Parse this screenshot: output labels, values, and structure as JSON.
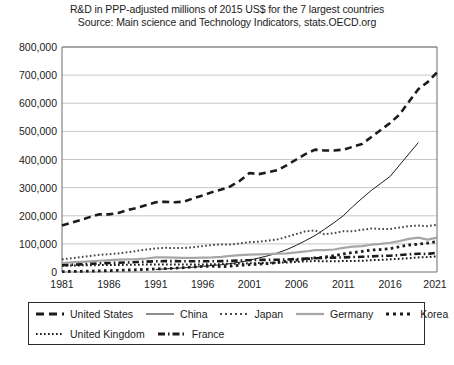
{
  "chart_data": {
    "type": "line",
    "title": "R&D in PPP-adjusted millions of 2015 US$ for the 7 largest countries",
    "subtitle": "Source: Main science and Technology Indicators, stats.OECD.org",
    "xlabel": "",
    "ylabel": "",
    "xlim": [
      1981,
      2021
    ],
    "ylim": [
      0,
      800000
    ],
    "grid": true,
    "legend_position": "bottom",
    "x_ticks": [
      "1981",
      "1986",
      "1991",
      "1996",
      "2001",
      "2006",
      "2011",
      "2016",
      "2021"
    ],
    "y_ticks": [
      "0",
      "100,000",
      "200,000",
      "300,000",
      "400,000",
      "500,000",
      "600,000",
      "700,000",
      "800,000"
    ],
    "x": [
      1981,
      1982,
      1983,
      1984,
      1985,
      1986,
      1987,
      1988,
      1989,
      1990,
      1991,
      1992,
      1993,
      1994,
      1995,
      1996,
      1997,
      1998,
      1999,
      2000,
      2001,
      2002,
      2003,
      2004,
      2005,
      2006,
      2007,
      2008,
      2009,
      2010,
      2011,
      2012,
      2013,
      2014,
      2015,
      2016,
      2017,
      2018,
      2019,
      2020,
      2021
    ],
    "series": [
      {
        "name": "United States",
        "style": "thick-dashed",
        "color": "#1b1b1b",
        "values": [
          165000,
          175000,
          185000,
          196000,
          205000,
          205000,
          210000,
          220000,
          228000,
          238000,
          248000,
          250000,
          248000,
          250000,
          262000,
          272000,
          284000,
          293000,
          305000,
          325000,
          352000,
          348000,
          355000,
          362000,
          380000,
          400000,
          420000,
          435000,
          432000,
          432000,
          435000,
          445000,
          455000,
          480000,
          505000,
          530000,
          560000,
          605000,
          650000,
          675000,
          710000
        ]
      },
      {
        "name": "China",
        "style": "thin-solid",
        "color": "#1b1b1b",
        "values": [
          null,
          null,
          null,
          null,
          null,
          null,
          null,
          null,
          null,
          null,
          9000,
          11000,
          13000,
          15000,
          17000,
          20000,
          23000,
          26000,
          30000,
          35000,
          42000,
          50000,
          58000,
          68000,
          80000,
          95000,
          112000,
          130000,
          152000,
          175000,
          200000,
          232000,
          262000,
          290000,
          315000,
          340000,
          380000,
          420000,
          460000,
          null,
          null
        ]
      },
      {
        "name": "Japan",
        "style": "fine-dotted",
        "color": "#4a4a4a",
        "values": [
          45000,
          49000,
          53000,
          57000,
          61000,
          63000,
          66000,
          70000,
          75000,
          80000,
          84000,
          86000,
          85000,
          85000,
          88000,
          92000,
          96000,
          98000,
          98000,
          102000,
          106000,
          108000,
          112000,
          116000,
          125000,
          135000,
          145000,
          148000,
          134000,
          138000,
          145000,
          145000,
          150000,
          155000,
          153000,
          153000,
          158000,
          163000,
          165000,
          163000,
          168000
        ]
      },
      {
        "name": "Germany",
        "style": "thick-gray-solid",
        "color": "#a6a6a6",
        "values": [
          32000,
          34000,
          36000,
          38000,
          40000,
          42000,
          44000,
          45000,
          46000,
          48000,
          52000,
          52000,
          51000,
          50000,
          50000,
          51000,
          52000,
          54000,
          57000,
          60000,
          62000,
          63000,
          64000,
          65000,
          66000,
          70000,
          73000,
          78000,
          78000,
          80000,
          86000,
          90000,
          92000,
          97000,
          100000,
          104000,
          110000,
          118000,
          122000,
          115000,
          122000
        ]
      },
      {
        "name": "Korea",
        "style": "bold-dotted",
        "color": "#1b1b1b",
        "values": [
          1500,
          2000,
          2500,
          3200,
          4000,
          5000,
          6000,
          7000,
          8000,
          9500,
          11000,
          12000,
          13500,
          15500,
          18000,
          20000,
          21000,
          19000,
          21000,
          24000,
          26000,
          28000,
          30000,
          34000,
          38000,
          42000,
          46000,
          50000,
          53000,
          58000,
          64000,
          69000,
          73000,
          78000,
          80000,
          83000,
          90000,
          96000,
          99000,
          103000,
          108000
        ]
      },
      {
        "name": "United Kingdom",
        "style": "fine-dotted",
        "color": "#1b1b1b",
        "values": [
          22000,
          23000,
          23500,
          24000,
          24500,
          24500,
          25000,
          25500,
          26000,
          26500,
          26500,
          26500,
          27000,
          27000,
          27000,
          27000,
          27500,
          28000,
          29000,
          30000,
          31000,
          32000,
          32500,
          33000,
          34000,
          36000,
          38000,
          39000,
          38000,
          38000,
          39000,
          39000,
          40000,
          42000,
          43000,
          45000,
          47000,
          49000,
          52000,
          53000,
          56000
        ]
      },
      {
        "name": "France",
        "style": "dash-dot",
        "color": "#1b1b1b",
        "values": [
          24000,
          25500,
          27000,
          29000,
          31000,
          32000,
          33000,
          34000,
          35500,
          37000,
          38000,
          38500,
          38500,
          38000,
          38000,
          38000,
          38000,
          38500,
          39500,
          41000,
          42000,
          43000,
          43000,
          43500,
          44500,
          46000,
          47500,
          49000,
          50000,
          51000,
          52000,
          53000,
          54000,
          55500,
          57000,
          58000,
          60000,
          63000,
          65000,
          64000,
          69000
        ]
      }
    ]
  },
  "legend": {
    "entries": [
      {
        "label": "United States",
        "swatch": "thick-dashed"
      },
      {
        "label": "China",
        "swatch": "thin-solid"
      },
      {
        "label": "Japan",
        "swatch": "fine-dotted"
      },
      {
        "label": "Germany",
        "swatch": "thick-gray-solid"
      },
      {
        "label": "Korea",
        "swatch": "bold-dotted"
      },
      {
        "label": "United Kingdom",
        "swatch": "fine-dotted"
      },
      {
        "label": "France",
        "swatch": "dash-dot"
      }
    ]
  },
  "caption": {
    "text": ""
  }
}
